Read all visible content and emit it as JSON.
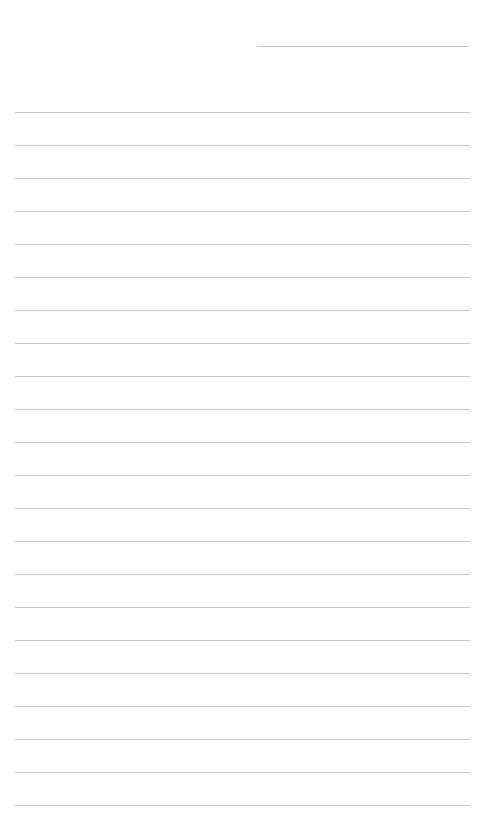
{
  "page": {
    "type": "lined-paper",
    "background": "#ffffff",
    "line_color": "#c8c8c8",
    "header_line": {
      "x": 257,
      "y": 46,
      "width": 211
    },
    "rule_lines": {
      "count": 22,
      "start_y": 112,
      "spacing": 33,
      "x": 15,
      "width": 455
    }
  }
}
